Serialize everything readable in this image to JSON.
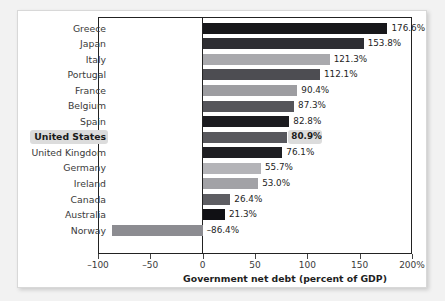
{
  "chart_data": {
    "type": "bar",
    "orientation": "horizontal",
    "title": "",
    "xlabel": "Government net debt (percent of GDP)",
    "ylabel": "",
    "xlim": [
      -100,
      200
    ],
    "xticks": [
      -100,
      -50,
      0,
      50,
      100,
      150,
      200
    ],
    "xtick_labels": [
      "–100",
      "–50",
      "0",
      "50",
      "100",
      "150",
      "200%"
    ],
    "grid": false,
    "legend": null,
    "categories": [
      "Greece",
      "Japan",
      "Italy",
      "Portugal",
      "France",
      "Belgium",
      "Spain",
      "United States",
      "United Kingdom",
      "Germany",
      "Ireland",
      "Canada",
      "Australia",
      "Norway"
    ],
    "values": [
      176.6,
      153.8,
      121.3,
      112.1,
      90.4,
      87.3,
      82.8,
      80.9,
      76.1,
      55.7,
      53.0,
      26.4,
      21.3,
      -86.4
    ],
    "value_labels": [
      "176.6%",
      "153.8%",
      "121.3%",
      "112.1%",
      "90.4%",
      "87.3%",
      "82.8%",
      "80.9%",
      "76.1%",
      "55.7%",
      "53.0%",
      "26.4%",
      "21.3%",
      "–86.4%"
    ],
    "bar_colors": [
      "#17171a",
      "#2e2e33",
      "#a9a9ad",
      "#4d4d52",
      "#9d9da1",
      "#55555a",
      "#1b1b1f",
      "#58585d",
      "#1e1e22",
      "#b4b4b8",
      "#a2a2a6",
      "#5e5e63",
      "#101014",
      "#8c8c91"
    ],
    "highlighted_category": "United States"
  },
  "figure": {
    "background": "#ffffff",
    "page_background": "#f2f2f2",
    "axis_color": "#222222",
    "highlight_color": "#dcdcdc"
  }
}
